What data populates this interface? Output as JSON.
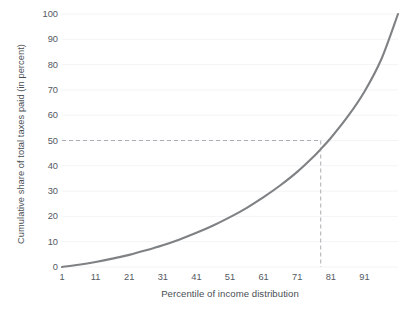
{
  "chart_data": {
    "type": "line",
    "title": "",
    "subtitle": "",
    "xlabel": "Percentile of income distribution",
    "ylabel": "Cumulative share of total taxes paid (in percent)",
    "xlim": [
      1,
      101
    ],
    "ylim": [
      0,
      100
    ],
    "xticks": [
      1,
      11,
      21,
      31,
      41,
      51,
      61,
      71,
      81,
      91
    ],
    "xtick_labels": [
      "1",
      "11",
      "21",
      "31",
      "41",
      "51",
      "61",
      "71",
      "81",
      "91"
    ],
    "yticks": [
      0,
      10,
      20,
      30,
      40,
      50,
      60,
      70,
      80,
      90,
      100
    ],
    "ytick_labels": [
      "0",
      "10",
      "20",
      "30",
      "40",
      "50",
      "60",
      "70",
      "80",
      "90",
      "100"
    ],
    "grid": "faint-horizontal",
    "legend": "none",
    "line_color": "#7f8285",
    "line_width": 2.1,
    "reference_line_color": "#a9acb0",
    "series": [
      {
        "name": "Cumulative share of total taxes paid",
        "x": [
          1,
          6,
          11,
          16,
          21,
          26,
          31,
          36,
          41,
          46,
          51,
          56,
          61,
          66,
          71,
          76,
          78,
          81,
          86,
          91,
          96,
          101
        ],
        "values": [
          0.0,
          0.9,
          2.0,
          3.3,
          4.8,
          6.6,
          8.6,
          10.9,
          13.5,
          16.4,
          19.7,
          23.4,
          27.6,
          32.3,
          37.6,
          43.8,
          46.6,
          51.0,
          59.4,
          69.3,
          82.0,
          100.0
        ]
      }
    ],
    "annotations": [
      {
        "name": "median-tax-share-reference",
        "type": "crosshair",
        "x": 78,
        "y": 50,
        "style": "dashed",
        "horizontal_from_axis": true,
        "vertical_to_axis": true
      }
    ]
  },
  "axes": {
    "y_title": "Cumulative share of total taxes paid (in percent)",
    "x_title": "Percentile of income distribution"
  }
}
